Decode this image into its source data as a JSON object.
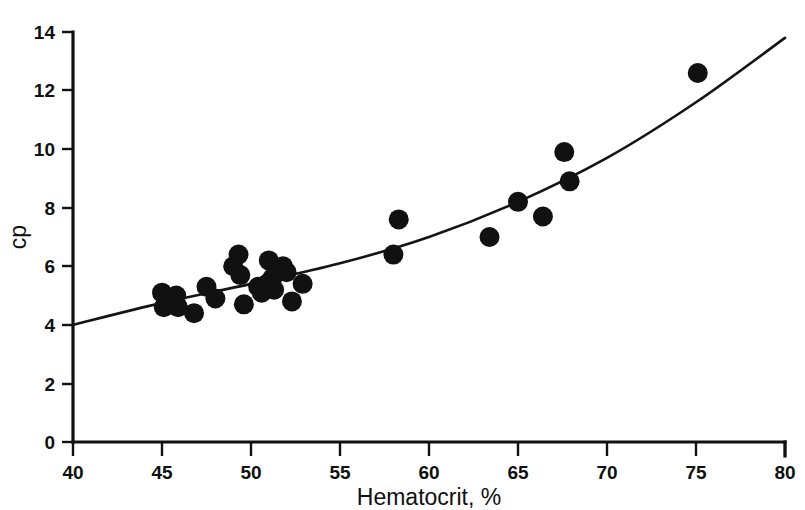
{
  "chart_data": {
    "type": "scatter",
    "title": "",
    "xlabel": "Hematocrit, %",
    "ylabel": "cp",
    "xlim": [
      40,
      80
    ],
    "ylim": [
      0,
      14
    ],
    "xticks": [
      40,
      45,
      50,
      55,
      60,
      65,
      70,
      75,
      80
    ],
    "yticks": [
      0,
      2,
      4,
      6,
      8,
      10,
      12,
      14
    ],
    "xtick_labels": [
      "40",
      "45",
      "50",
      "55",
      "60",
      "65",
      "70",
      "75",
      "80"
    ],
    "ytick_labels": [
      "0",
      "2",
      "4",
      "6",
      "8",
      "10",
      "12",
      "14"
    ],
    "grid": false,
    "legend": null,
    "marker": "filled-circle",
    "marker_color": "#111111",
    "points": [
      {
        "x": 45.0,
        "y": 5.1
      },
      {
        "x": 45.1,
        "y": 4.6
      },
      {
        "x": 45.8,
        "y": 5.0
      },
      {
        "x": 45.9,
        "y": 4.6
      },
      {
        "x": 46.8,
        "y": 4.4
      },
      {
        "x": 47.5,
        "y": 5.3
      },
      {
        "x": 48.0,
        "y": 4.9
      },
      {
        "x": 49.0,
        "y": 6.0
      },
      {
        "x": 49.3,
        "y": 6.4
      },
      {
        "x": 49.4,
        "y": 5.7
      },
      {
        "x": 49.6,
        "y": 4.7
      },
      {
        "x": 50.4,
        "y": 5.3
      },
      {
        "x": 50.6,
        "y": 5.1
      },
      {
        "x": 50.9,
        "y": 5.4
      },
      {
        "x": 51.0,
        "y": 6.2
      },
      {
        "x": 51.2,
        "y": 5.6
      },
      {
        "x": 51.3,
        "y": 5.2
      },
      {
        "x": 51.8,
        "y": 6.0
      },
      {
        "x": 52.0,
        "y": 5.8
      },
      {
        "x": 52.3,
        "y": 4.8
      },
      {
        "x": 52.9,
        "y": 5.4
      },
      {
        "x": 58.0,
        "y": 6.4
      },
      {
        "x": 58.3,
        "y": 7.6
      },
      {
        "x": 63.4,
        "y": 7.0
      },
      {
        "x": 65.0,
        "y": 8.2
      },
      {
        "x": 66.4,
        "y": 7.7
      },
      {
        "x": 67.6,
        "y": 9.9
      },
      {
        "x": 67.9,
        "y": 8.9
      },
      {
        "x": 75.1,
        "y": 12.6
      }
    ],
    "fit_curve": {
      "description": "smooth monotonic increasing trend line",
      "points": [
        {
          "x": 40.0,
          "y": 4.0
        },
        {
          "x": 45.0,
          "y": 4.75
        },
        {
          "x": 50.0,
          "y": 5.4
        },
        {
          "x": 55.0,
          "y": 6.1
        },
        {
          "x": 60.0,
          "y": 7.0
        },
        {
          "x": 65.0,
          "y": 8.2
        },
        {
          "x": 70.0,
          "y": 9.7
        },
        {
          "x": 75.0,
          "y": 11.6
        },
        {
          "x": 80.0,
          "y": 13.8
        }
      ]
    }
  }
}
